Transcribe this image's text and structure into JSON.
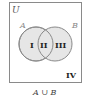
{
  "diagram": {
    "type": "venn",
    "universe_label": "U",
    "set_a_label": "A",
    "set_b_label": "B",
    "regions": {
      "a_only": "I",
      "intersection": "II",
      "b_only": "III",
      "outside": "IV"
    },
    "caption": "A ∪ B",
    "colors": {
      "shade": "#e6e6e6",
      "outline": "#8a8a8a",
      "text": "#222222",
      "set_label": "#888888"
    }
  }
}
